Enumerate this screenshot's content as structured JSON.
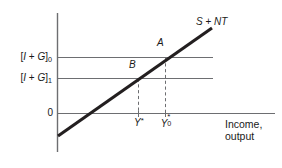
{
  "figure": {
    "type": "economics-line-diagram",
    "background_color": "#ffffff"
  },
  "axes": {
    "y_axis": {
      "label": "",
      "origin_label": "0"
    },
    "x_axis": {
      "label_line1": "Income,",
      "label_line2": "output"
    }
  },
  "levels": [
    {
      "id": "level-0",
      "text_prefix": "[",
      "text_I": "I",
      "text_plus": " + ",
      "text_G": "G",
      "text_suffix": "]",
      "subscript": "0",
      "value_y": 57
    },
    {
      "id": "level-1",
      "text_prefix": "[",
      "text_I": "I",
      "text_plus": " + ",
      "text_G": "G",
      "text_suffix": "]",
      "subscript": "1",
      "value_y": 78
    }
  ],
  "curve": {
    "label_S": "S",
    "label_plus": " + ",
    "label_NT": "NT",
    "color": "#231f20"
  },
  "points": [
    {
      "id": "point-a",
      "label": "A",
      "x": 165,
      "y": 57
    },
    {
      "id": "point-b",
      "label": "B",
      "x": 138,
      "y": 78
    }
  ],
  "x_ticks": [
    {
      "id": "tick-ystar",
      "base": "Y",
      "superscript": "*",
      "subscript": "",
      "x": 138
    },
    {
      "id": "tick-ystar-0",
      "base": "Y",
      "superscript": "*",
      "subscript": "0",
      "x": 165
    }
  ],
  "colors": {
    "line": "#231f20",
    "axis": "#6d6e71",
    "gridline": "#6d6e71",
    "dashed": "#6d6e71",
    "text": "#1a1a1a"
  }
}
